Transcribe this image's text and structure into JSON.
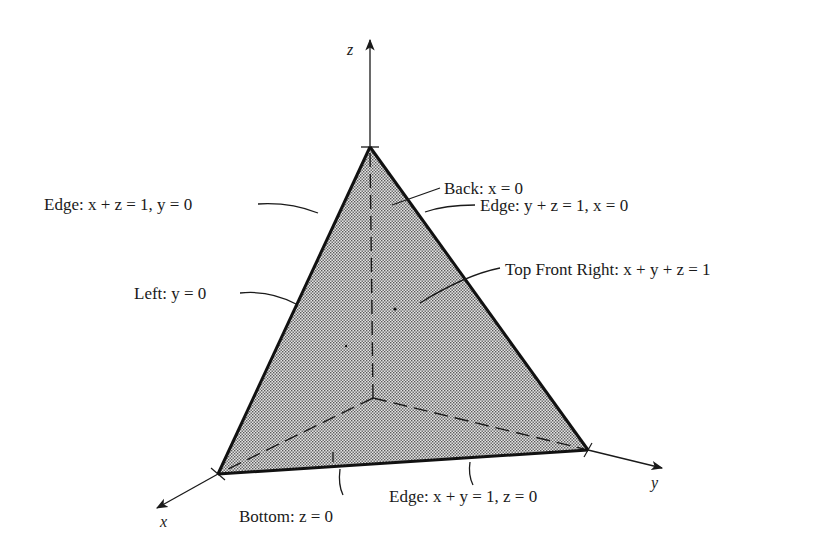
{
  "diagram": {
    "type": "3d-tetrahedron-region",
    "axes": {
      "x": "x",
      "y": "y",
      "z": "z"
    },
    "labels": {
      "back": "Back: x = 0",
      "edge_yz": "Edge: y + z = 1, x = 0",
      "edge_xz": "Edge: x + z = 1, y = 0",
      "left": "Left: y = 0",
      "top_front_right": "Top Front Right: x + y + z = 1",
      "bottom": "Bottom: z = 0",
      "edge_xy": "Edge: x + y = 1, z = 0"
    },
    "colors": {
      "stroke": "#1a1a1a",
      "fill_shade": "#c8c8c8",
      "background": "#ffffff"
    }
  }
}
